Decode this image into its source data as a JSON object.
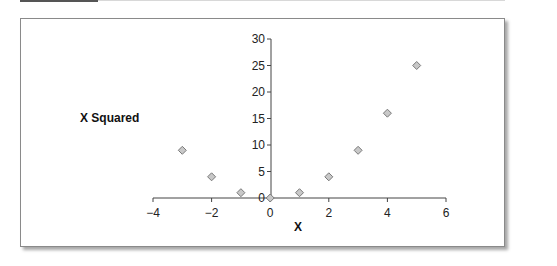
{
  "chart_data": {
    "type": "scatter",
    "title": "",
    "xlabel": "X",
    "ylabel": "X Squared",
    "xlim": [
      -4,
      6
    ],
    "ylim": [
      0,
      30
    ],
    "xticks": [
      -4,
      -2,
      0,
      2,
      4,
      6
    ],
    "yticks": [
      0,
      5,
      10,
      15,
      20,
      25,
      30
    ],
    "grid": false,
    "legend": null,
    "marker": "diamond",
    "marker_color": "#c8c8c8",
    "marker_edge": "#7a7a7a",
    "series": [
      {
        "name": "X Squared",
        "x": [
          -3,
          -2,
          -1,
          0,
          1,
          2,
          3,
          4,
          5
        ],
        "y": [
          9,
          4,
          1,
          0,
          1,
          4,
          9,
          16,
          25
        ]
      }
    ]
  },
  "labels": {
    "xlabel": "X",
    "ylabel": "X Squared",
    "xticks": [
      "−4",
      "−2",
      "0",
      "2",
      "4",
      "6"
    ],
    "yticks": [
      "0",
      "5",
      "10",
      "15",
      "20",
      "25",
      "30"
    ]
  }
}
